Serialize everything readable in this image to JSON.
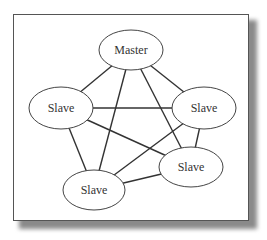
{
  "diagram": {
    "type": "network-topology",
    "nodes": [
      {
        "id": "master",
        "label": "Master",
        "cx": 131,
        "cy": 50,
        "rx": 32,
        "ry": 20
      },
      {
        "id": "slave-left",
        "label": "Slave",
        "cx": 61,
        "cy": 108,
        "rx": 32,
        "ry": 21
      },
      {
        "id": "slave-right",
        "label": "Slave",
        "cx": 204,
        "cy": 108,
        "rx": 32,
        "ry": 21
      },
      {
        "id": "slave-bottom-right",
        "label": "Slave",
        "cx": 191,
        "cy": 167,
        "rx": 32,
        "ry": 20
      },
      {
        "id": "slave-bottom-left",
        "label": "Slave",
        "cx": 94,
        "cy": 190,
        "rx": 31,
        "ry": 20
      }
    ],
    "edges": [
      [
        "master",
        "slave-left"
      ],
      [
        "master",
        "slave-right"
      ],
      [
        "master",
        "slave-bottom-left"
      ],
      [
        "master",
        "slave-bottom-right"
      ],
      [
        "slave-left",
        "slave-right"
      ],
      [
        "slave-left",
        "slave-bottom-left"
      ],
      [
        "slave-left",
        "slave-bottom-right"
      ],
      [
        "slave-right",
        "slave-bottom-left"
      ],
      [
        "slave-right",
        "slave-bottom-right"
      ],
      [
        "slave-bottom-left",
        "slave-bottom-right"
      ]
    ],
    "colors": {
      "stroke": "#444444",
      "edge": "#333333",
      "fill": "#ffffff",
      "frame": "#555555"
    }
  }
}
